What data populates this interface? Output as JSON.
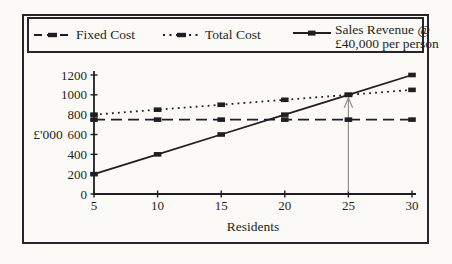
{
  "page": {
    "ink_color": "#1f1f22",
    "frame_color": "#26262a",
    "background_color": "#fbfaf6",
    "arrow_color": "#8f8f8f"
  },
  "legend": {
    "items": [
      {
        "label": "Fixed Cost",
        "line_style": "dashed"
      },
      {
        "label": "Total Cost",
        "line_style": "dotted"
      },
      {
        "label": "Sales Revenue @",
        "label2": "£40,000 per person",
        "line_style": "solid"
      }
    ]
  },
  "chart_data": {
    "type": "line",
    "x": [
      5,
      10,
      15,
      20,
      25,
      30
    ],
    "xlabel": "Residents",
    "ylabel": "£'000",
    "xlim": [
      5,
      30
    ],
    "ylim": [
      0,
      1200
    ],
    "yticks": [
      0,
      200,
      400,
      600,
      800,
      1000,
      1200
    ],
    "xticks": [
      5,
      10,
      15,
      20,
      25,
      30
    ],
    "grid": false,
    "legend_position": "top",
    "marker": "filled-square",
    "series": [
      {
        "name": "Fixed Cost",
        "style": "dashed",
        "values": [
          750,
          750,
          750,
          750,
          750,
          750
        ]
      },
      {
        "name": "Total Cost",
        "style": "dotted",
        "values": [
          800,
          850,
          900,
          950,
          1000,
          1050
        ]
      },
      {
        "name": "Sales Revenue @ £40,000 per person",
        "style": "solid",
        "values": [
          200,
          400,
          600,
          800,
          1000,
          1200
        ]
      }
    ],
    "annotations": [
      {
        "type": "vertical-arrow-up",
        "x": 25,
        "y_tip": 1000,
        "y_base": 0
      }
    ]
  }
}
